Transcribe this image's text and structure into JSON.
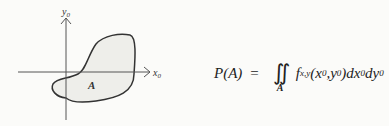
{
  "diagram": {
    "y_axis_label": "y",
    "y_axis_sub": "0",
    "x_axis_label": "x",
    "x_axis_sub": "0",
    "region_label": "A",
    "region_fill": "#eeeeea",
    "stroke_color": "#333333"
  },
  "formula": {
    "lhs": "P(A)",
    "equals": "=",
    "integral": "∬",
    "integral_region": "A",
    "f": "f",
    "f_sub": "x,y",
    "args": "(x",
    "arg1_sub": "0",
    "comma": ",y",
    "arg2_sub": "0",
    "close": ")dx",
    "dx_sub": "0",
    "dy": "dy",
    "dy_sub": "0"
  }
}
